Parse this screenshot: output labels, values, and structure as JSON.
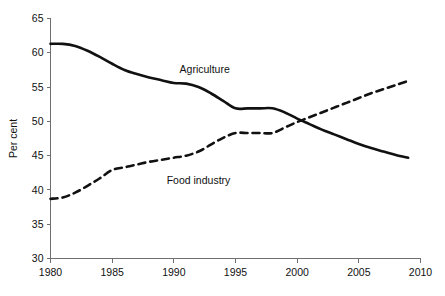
{
  "chart_data": {
    "type": "line",
    "title": "",
    "xlabel": "",
    "ylabel": "Per cent",
    "xlim": [
      1980,
      2010
    ],
    "ylim": [
      30,
      65
    ],
    "grid": false,
    "legend_position": "inline-annotations",
    "x_ticks": [
      "1980",
      "1985",
      "1990",
      "1995",
      "2000",
      "2005",
      "2010"
    ],
    "y_ticks": [
      "30",
      "35",
      "40",
      "45",
      "50",
      "55",
      "60",
      "65"
    ],
    "series": [
      {
        "name": "Agriculture",
        "style": "solid",
        "color": "#111111",
        "label_x": 1992.5,
        "label_y": 57.6,
        "x": [
          1980,
          1981,
          1982,
          1983,
          1984,
          1985,
          1986,
          1987,
          1988,
          1989,
          1990,
          1991,
          1992,
          1993,
          1994,
          1995,
          1996,
          1997,
          1998,
          1999,
          2000,
          2001,
          2002,
          2003,
          2004,
          2005,
          2006,
          2007,
          2008,
          2009
        ],
        "values": [
          61.3,
          61.3,
          61.0,
          60.3,
          59.4,
          58.4,
          57.5,
          56.9,
          56.4,
          56.0,
          55.6,
          55.5,
          55.0,
          54.1,
          53.0,
          51.9,
          51.9,
          51.9,
          51.9,
          51.3,
          50.4,
          49.6,
          48.8,
          48.1,
          47.4,
          46.7,
          46.1,
          45.6,
          45.1,
          44.7
        ]
      },
      {
        "name": "Food industry",
        "style": "dashed",
        "color": "#111111",
        "label_x": 1992.0,
        "label_y": 41.4,
        "x": [
          1980,
          1981,
          1982,
          1983,
          1984,
          1985,
          1986,
          1987,
          1988,
          1989,
          1990,
          1991,
          1992,
          1993,
          1994,
          1995,
          1996,
          1997,
          1998,
          1999,
          2000,
          2001,
          2002,
          2003,
          2004,
          2005,
          2006,
          2007,
          2008,
          2009
        ],
        "values": [
          38.7,
          38.9,
          39.6,
          40.6,
          41.7,
          42.9,
          43.3,
          43.7,
          44.1,
          44.4,
          44.7,
          45.0,
          45.6,
          46.6,
          47.6,
          48.3,
          48.3,
          48.3,
          48.3,
          49.1,
          49.9,
          50.6,
          51.3,
          52.0,
          52.7,
          53.4,
          54.1,
          54.7,
          55.3,
          55.9
        ]
      }
    ]
  }
}
